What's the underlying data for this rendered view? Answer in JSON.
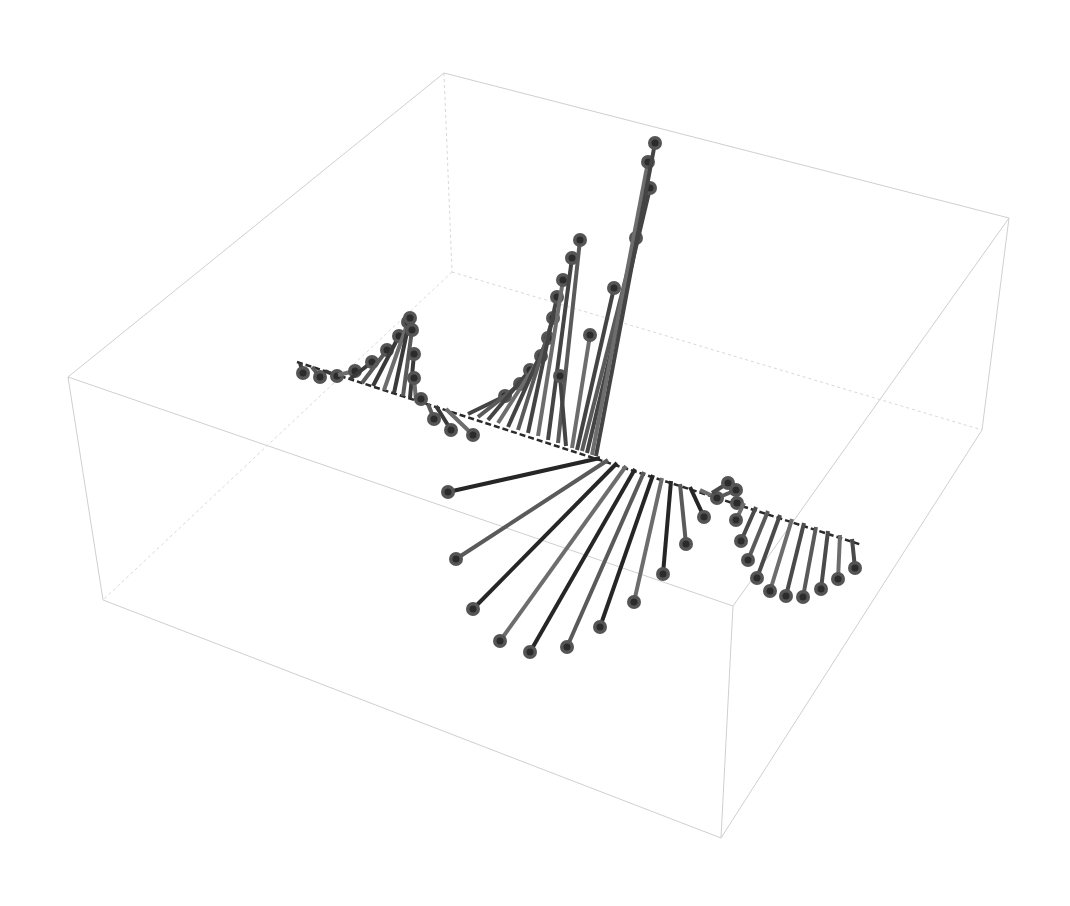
{
  "chart_data": {
    "type": "stem3d",
    "title": "",
    "xlabel": "",
    "ylabel": "",
    "zlabel": "",
    "grid": false,
    "legend": null,
    "box": {
      "stroke": "#cfcfcf",
      "corners_2d": {
        "top_back_left": [
          444,
          73
        ],
        "top_back_right": [
          1009,
          218
        ],
        "top_front_left": [
          68,
          377
        ],
        "top_front_right": [
          733,
          606
        ],
        "bottom_back_left": [
          452,
          272
        ],
        "bottom_back_right": [
          982,
          430
        ],
        "bottom_front_left": [
          103,
          600
        ],
        "bottom_front_right": [
          721,
          838
        ]
      }
    },
    "spine": {
      "from": [
        297,
        362
      ],
      "to": [
        862,
        545
      ],
      "color": "#2a2a2a"
    },
    "series": [
      {
        "name": "left-wave",
        "color": "#3a3a3a",
        "stems": [
          {
            "base": [
              300,
              363
            ],
            "tip": [
              303,
              373
            ]
          },
          {
            "base": [
              312,
              367
            ],
            "tip": [
              320,
              377
            ]
          },
          {
            "base": [
              325,
              371
            ],
            "tip": [
              337,
              376
            ]
          },
          {
            "base": [
              338,
              375
            ],
            "tip": [
              355,
              371
            ]
          },
          {
            "base": [
              350,
              379
            ],
            "tip": [
              372,
              362
            ]
          },
          {
            "base": [
              362,
              383
            ],
            "tip": [
              387,
              350
            ]
          },
          {
            "base": [
              373,
              386
            ],
            "tip": [
              399,
              336
            ]
          },
          {
            "base": [
              384,
              390
            ],
            "tip": [
              408,
              322
            ]
          },
          {
            "base": [
              394,
              393
            ],
            "tip": [
              410,
              318
            ]
          },
          {
            "base": [
              403,
              396
            ],
            "tip": [
              412,
              330
            ]
          },
          {
            "base": [
              410,
              398
            ],
            "tip": [
              414,
              354
            ]
          },
          {
            "base": [
              416,
              400
            ],
            "tip": [
              414,
              378
            ]
          },
          {
            "base": [
              422,
              402
            ],
            "tip": [
              421,
              399
            ]
          },
          {
            "base": [
              428,
              404
            ],
            "tip": [
              434,
              419
            ]
          },
          {
            "base": [
              436,
              406
            ],
            "tip": [
              451,
              430
            ]
          },
          {
            "base": [
              446,
              409
            ],
            "tip": [
              473,
              435
            ]
          }
        ]
      },
      {
        "name": "up-fan",
        "color": "#444444",
        "stems": [
          {
            "base": [
              468,
              414
            ],
            "tip": [
              505,
              396
            ]
          },
          {
            "base": [
              478,
              417
            ],
            "tip": [
              520,
              384
            ]
          },
          {
            "base": [
              488,
              420
            ],
            "tip": [
              530,
              370
            ]
          },
          {
            "base": [
              498,
              423
            ],
            "tip": [
              541,
              356
            ]
          },
          {
            "base": [
              508,
              427
            ],
            "tip": [
              548,
              338
            ]
          },
          {
            "base": [
              518,
              430
            ],
            "tip": [
              553,
              318
            ]
          },
          {
            "base": [
              528,
              433
            ],
            "tip": [
              557,
              297
            ]
          },
          {
            "base": [
              538,
              436
            ],
            "tip": [
              563,
              280
            ]
          },
          {
            "base": [
              548,
              440
            ],
            "tip": [
              572,
              258
            ]
          },
          {
            "base": [
              558,
              443
            ],
            "tip": [
              580,
              240
            ]
          },
          {
            "base": [
              566,
              446
            ],
            "tip": [
              560,
              376
            ]
          },
          {
            "base": [
              572,
              448
            ],
            "tip": [
              590,
              335
            ]
          },
          {
            "base": [
              577,
              450
            ],
            "tip": [
              614,
              288
            ]
          },
          {
            "base": [
              582,
              451
            ],
            "tip": [
              636,
              238
            ]
          },
          {
            "base": [
              587,
              453
            ],
            "tip": [
              650,
              188
            ]
          },
          {
            "base": [
              592,
              455
            ],
            "tip": [
              648,
              162
            ]
          },
          {
            "base": [
              596,
              456
            ],
            "tip": [
              655,
              143
            ]
          }
        ]
      },
      {
        "name": "down-fan",
        "color": "#262626",
        "stems": [
          {
            "base": [
              600,
              458
            ],
            "tip": [
              448,
              492
            ]
          },
          {
            "base": [
              608,
              460
            ],
            "tip": [
              456,
              559
            ]
          },
          {
            "base": [
              617,
              463
            ],
            "tip": [
              473,
              609
            ]
          },
          {
            "base": [
              626,
              466
            ],
            "tip": [
              500,
              641
            ]
          },
          {
            "base": [
              635,
              469
            ],
            "tip": [
              530,
              652
            ]
          },
          {
            "base": [
              644,
              472
            ],
            "tip": [
              567,
              647
            ]
          },
          {
            "base": [
              653,
              475
            ],
            "tip": [
              600,
              627
            ]
          },
          {
            "base": [
              662,
              478
            ],
            "tip": [
              634,
              602
            ]
          },
          {
            "base": [
              671,
              481
            ],
            "tip": [
              663,
              574
            ]
          },
          {
            "base": [
              680,
              484
            ],
            "tip": [
              686,
              544
            ]
          },
          {
            "base": [
              690,
              487
            ],
            "tip": [
              704,
              517
            ]
          },
          {
            "base": [
              700,
              490
            ],
            "tip": [
              717,
              498
            ]
          }
        ]
      },
      {
        "name": "right-fan",
        "color": "#4a4a4a",
        "stems": [
          {
            "base": [
              712,
              493
            ],
            "tip": [
              728,
              483
            ]
          },
          {
            "base": [
              722,
              496
            ],
            "tip": [
              736,
              490
            ]
          },
          {
            "base": [
              732,
              499
            ],
            "tip": [
              737,
              503
            ]
          },
          {
            "base": [
              744,
              503
            ],
            "tip": [
              736,
              520
            ]
          },
          {
            "base": [
              756,
              507
            ],
            "tip": [
              741,
              541
            ]
          },
          {
            "base": [
              768,
              511
            ],
            "tip": [
              748,
              560
            ]
          },
          {
            "base": [
              780,
              515
            ],
            "tip": [
              757,
              578
            ]
          },
          {
            "base": [
              792,
              519
            ],
            "tip": [
              770,
              591
            ]
          },
          {
            "base": [
              804,
              523
            ],
            "tip": [
              786,
              596
            ]
          },
          {
            "base": [
              816,
              527
            ],
            "tip": [
              803,
              597
            ]
          },
          {
            "base": [
              828,
              531
            ],
            "tip": [
              821,
              589
            ]
          },
          {
            "base": [
              840,
              535
            ],
            "tip": [
              838,
              579
            ]
          },
          {
            "base": [
              852,
              539
            ],
            "tip": [
              855,
              568
            ]
          }
        ]
      }
    ]
  }
}
